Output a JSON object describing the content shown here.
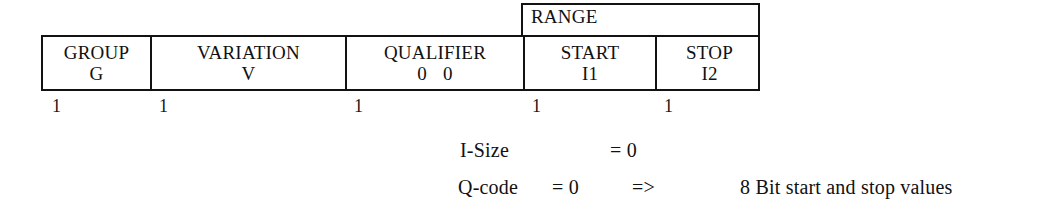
{
  "figure": {
    "table": {
      "span_header": {
        "label": "RANGE",
        "covers": [
          "START",
          "STOP"
        ]
      },
      "columns": [
        {
          "name": "GROUP",
          "line1": "GROUP",
          "line2": "G",
          "size": "1"
        },
        {
          "name": "VARIATION",
          "line1": "VARIATION",
          "line2": "V",
          "size": "1"
        },
        {
          "name": "QUALIFIER",
          "line1": "QUALIFIER",
          "line2_a": "0",
          "line2_b": "0",
          "size": "1"
        },
        {
          "name": "START",
          "line1": "START",
          "line2": "I1",
          "size": "1"
        },
        {
          "name": "STOP",
          "line1": "STOP",
          "line2": "I2",
          "size": "1"
        }
      ]
    },
    "notes": {
      "isize": {
        "label": "I-Size",
        "value": "= 0"
      },
      "qcode": {
        "label": "Q-code",
        "value": "= 0",
        "arrow": "=>",
        "description": "8 Bit start and stop values"
      }
    }
  },
  "colors": {
    "background": "#ffffff",
    "ink": "#121212",
    "border": "#121212"
  }
}
